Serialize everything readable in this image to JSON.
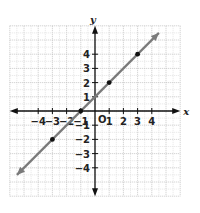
{
  "chart_data": {
    "type": "line",
    "title": "",
    "xlabel": "x",
    "ylabel": "y",
    "origin_label": "O",
    "xlim": [
      -6,
      6
    ],
    "ylim": [
      -6,
      6
    ],
    "grid": true,
    "x_ticks": [
      -4,
      -3,
      -2,
      -1,
      1,
      2,
      3,
      4
    ],
    "y_ticks": [
      -4,
      -3,
      -2,
      -1,
      1,
      2,
      3,
      4
    ],
    "x_tick_labels": [
      "−4",
      "−3",
      "−2",
      "−1",
      "1",
      "2",
      "3",
      "4"
    ],
    "y_tick_labels": [
      "−4",
      "−3",
      "−2",
      "−1",
      "1",
      "2",
      "3",
      "4"
    ],
    "series": [
      {
        "name": "y = x + 1",
        "equation": "y = x + 1",
        "color": "#7a7a7a",
        "line_endpoints": [
          [
            -5.5,
            -4.5
          ],
          [
            4.5,
            5.5
          ]
        ],
        "arrows": "both",
        "points": [
          [
            -3,
            -2
          ],
          [
            -1,
            0
          ],
          [
            0,
            1
          ],
          [
            1,
            2
          ],
          [
            3,
            4
          ]
        ],
        "marked_points": [
          [
            -3,
            -2
          ],
          [
            -1,
            0
          ],
          [
            1,
            2
          ],
          [
            3,
            4
          ]
        ]
      }
    ]
  }
}
